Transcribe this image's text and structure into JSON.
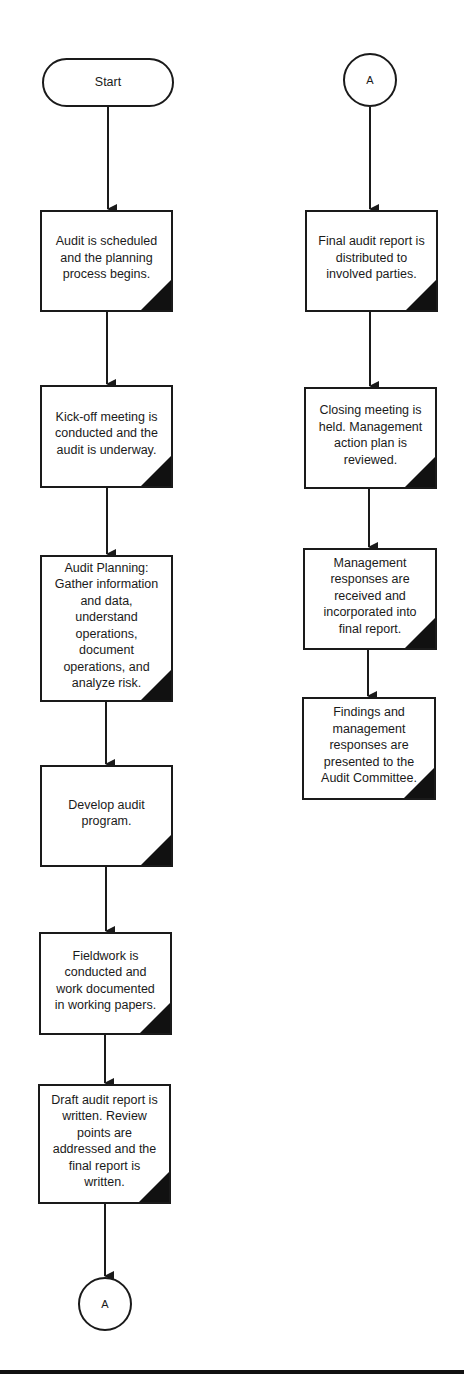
{
  "diagram": {
    "type": "flowchart",
    "left_column": {
      "start": {
        "label": "Start",
        "shape": "terminal",
        "box": [
          42,
          58,
          132,
          49
        ]
      },
      "steps": [
        {
          "label": "Audit is scheduled and the planning process begins.",
          "box": [
            40,
            210,
            133,
            102
          ]
        },
        {
          "label": "Kick-off meeting is conducted and the audit is underway.",
          "box": [
            40,
            385,
            133,
            103
          ]
        },
        {
          "label": "Audit Planning: Gather information and data, understand operations, document operations, and analyze risk.",
          "box": [
            40,
            555,
            133,
            147
          ]
        },
        {
          "label": "Develop audit program.",
          "box": [
            40,
            765,
            133,
            102
          ]
        },
        {
          "label": "Fieldwork is conducted and work documented in working papers.",
          "box": [
            39,
            932,
            133,
            103
          ]
        },
        {
          "label": "Draft audit report is written. Review points are addressed and the final report is written.",
          "box": [
            38,
            1084,
            133,
            120
          ]
        }
      ],
      "end_connector": {
        "label": "A",
        "shape": "connector",
        "box": [
          78,
          1277,
          54,
          54
        ]
      }
    },
    "right_column": {
      "start_connector": {
        "label": "A",
        "shape": "connector",
        "box": [
          343,
          53,
          54,
          54
        ]
      },
      "steps": [
        {
          "label": "Final audit report is distributed to involved parties.",
          "box": [
            305,
            210,
            133,
            102
          ]
        },
        {
          "label": "Closing meeting is held. Management action plan is reviewed.",
          "box": [
            304,
            387,
            133,
            102
          ]
        },
        {
          "label": "Management responses are received and incorporated into final report.",
          "box": [
            303,
            548,
            134,
            102
          ]
        },
        {
          "label": "Findings and management responses are presented to the Audit Committee.",
          "box": [
            302,
            697,
            134,
            103
          ]
        }
      ]
    },
    "edges": [
      [
        "Start",
        "Audit is scheduled"
      ],
      [
        "Audit is scheduled",
        "Kick-off meeting"
      ],
      [
        "Kick-off meeting",
        "Audit Planning"
      ],
      [
        "Audit Planning",
        "Develop audit program"
      ],
      [
        "Develop audit program",
        "Fieldwork"
      ],
      [
        "Fieldwork",
        "Draft audit report"
      ],
      [
        "Draft audit report",
        "A"
      ],
      [
        "A",
        "Final audit report"
      ],
      [
        "Final audit report",
        "Closing meeting"
      ],
      [
        "Closing meeting",
        "Management responses"
      ],
      [
        "Management responses",
        "Findings and management responses"
      ]
    ],
    "colors": {
      "line": "#1a1a1a",
      "fill": "#ffffff",
      "corner": "#111111"
    }
  }
}
